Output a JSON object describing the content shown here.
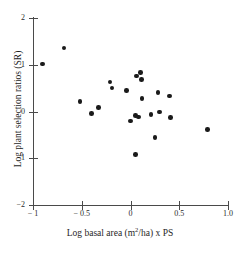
{
  "chart_data": {
    "type": "scatter",
    "title": "",
    "xlabel": "Log basal area (m2/ha) x PS",
    "xlabel_parts": {
      "before": "Log basal area (m",
      "sup": "2",
      "after": "/ha) x PS"
    },
    "ylabel": "Log plant selection ratios (SR)",
    "xlim": [
      -1,
      1
    ],
    "ylim": [
      -2,
      2
    ],
    "xticks": [
      -1,
      -0.5,
      0,
      0.5,
      1
    ],
    "xtick_labels": [
      "− 1",
      "− 0.5",
      "0",
      "0.5",
      "1.0"
    ],
    "yticks": [
      -2,
      -1,
      0,
      1,
      2
    ],
    "ytick_labels": [
      "−2",
      "−1",
      "0",
      "1",
      "2"
    ],
    "grid": false,
    "legend": false,
    "marker": "filled-circle",
    "marker_color": "#1a1a1a",
    "axis_color": "#4a4a4a",
    "background": "#ffffff",
    "n_points": 23,
    "points": [
      {
        "x": -0.9,
        "y": 1.02
      },
      {
        "x": -0.68,
        "y": 1.36
      },
      {
        "x": -0.52,
        "y": 0.21
      },
      {
        "x": -0.4,
        "y": -0.04
      },
      {
        "x": -0.33,
        "y": 0.09
      },
      {
        "x": -0.21,
        "y": 0.63
      },
      {
        "x": -0.19,
        "y": 0.5
      },
      {
        "x": -0.04,
        "y": 0.45
      },
      {
        "x": 0.06,
        "y": 0.76
      },
      {
        "x": 0.1,
        "y": 0.83
      },
      {
        "x": 0.11,
        "y": 0.68
      },
      {
        "x": 0.12,
        "y": 0.28
      },
      {
        "x": 0.0,
        "y": -0.2
      },
      {
        "x": 0.05,
        "y": -0.09
      },
      {
        "x": 0.08,
        "y": -0.12
      },
      {
        "x": 0.21,
        "y": -0.06
      },
      {
        "x": 0.28,
        "y": 0.41
      },
      {
        "x": 0.3,
        "y": -0.01
      },
      {
        "x": 0.4,
        "y": 0.33
      },
      {
        "x": 0.41,
        "y": -0.13
      },
      {
        "x": 0.25,
        "y": -0.55
      },
      {
        "x": 0.05,
        "y": -0.92
      },
      {
        "x": 0.79,
        "y": -0.38
      }
    ]
  }
}
